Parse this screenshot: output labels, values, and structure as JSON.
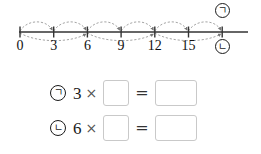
{
  "worksheet": {
    "background_color": "#ffffff",
    "line_color": "#333333",
    "arc_color": "#9a9a9a",
    "box_border_color": "#c9c9c9"
  },
  "numberline": {
    "name": "number-line-diagram",
    "ticks": [
      {
        "value": 0,
        "label": "0"
      },
      {
        "value": 3,
        "label": "3"
      },
      {
        "value": 6,
        "label": "6"
      },
      {
        "value": 9,
        "label": "9"
      },
      {
        "value": 12,
        "label": "12"
      },
      {
        "value": 15,
        "label": "15"
      },
      {
        "value": 18,
        "label": ""
      }
    ],
    "tick_spacing_px": 33.7,
    "origin_x_px": 20,
    "axis_y_px": 32,
    "axis_end_x_px": 248,
    "top_arcs": [
      {
        "from": 0,
        "to": 3
      },
      {
        "from": 3,
        "to": 6
      },
      {
        "from": 6,
        "to": 9
      },
      {
        "from": 9,
        "to": 12
      },
      {
        "from": 12,
        "to": 15
      },
      {
        "from": 15,
        "to": 18
      }
    ],
    "bottom_arcs": [
      {
        "from": 0,
        "to": 6
      },
      {
        "from": 6,
        "to": 12
      },
      {
        "from": 12,
        "to": 18
      }
    ],
    "marker_top": {
      "symbol": "ㄱ",
      "value": 18
    },
    "marker_bottom": {
      "symbol": "ㄴ",
      "value": 18
    }
  },
  "equations": [
    {
      "tag": "ㄱ",
      "factor": "3",
      "times": "×",
      "operand_value": "",
      "operand_placeholder": "",
      "equals": "=",
      "result_value": "",
      "result_placeholder": ""
    },
    {
      "tag": "ㄴ",
      "factor": "6",
      "times": "×",
      "operand_value": "",
      "operand_placeholder": "",
      "equals": "=",
      "result_value": "",
      "result_placeholder": ""
    }
  ]
}
